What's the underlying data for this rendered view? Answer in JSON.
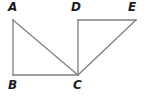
{
  "figure": {
    "kind": "geometry-diagram",
    "background_color": "#ffffff",
    "stroke_color": "#808080",
    "label_color": "#1c1c1c",
    "stroke_width": 1.3,
    "canvas": {
      "width": 148,
      "height": 102
    },
    "points": [
      {
        "id": "A",
        "label": "A",
        "x": 13,
        "y": 20,
        "label_x": 8,
        "label_y": 1
      },
      {
        "id": "B",
        "label": "B",
        "x": 13,
        "y": 75,
        "label_x": 8,
        "label_y": 79
      },
      {
        "id": "C",
        "label": "C",
        "x": 78,
        "y": 75,
        "label_x": 73,
        "label_y": 79
      },
      {
        "id": "D",
        "label": "D",
        "x": 78,
        "y": 20,
        "label_x": 71,
        "label_y": 1
      },
      {
        "id": "E",
        "label": "E",
        "x": 136,
        "y": 20,
        "label_x": 128,
        "label_y": 1
      }
    ],
    "segments": [
      {
        "id": "AB",
        "from": "A",
        "to": "B",
        "x1": 13,
        "y1": 20,
        "x2": 13,
        "y2": 75
      },
      {
        "id": "BC",
        "from": "B",
        "to": "C",
        "x1": 13,
        "y1": 75,
        "x2": 78,
        "y2": 75
      },
      {
        "id": "AC",
        "from": "A",
        "to": "C",
        "x1": 13,
        "y1": 20,
        "x2": 78,
        "y2": 75
      },
      {
        "id": "DC",
        "from": "D",
        "to": "C",
        "x1": 78,
        "y1": 20,
        "x2": 78,
        "y2": 75
      },
      {
        "id": "DE",
        "from": "D",
        "to": "E",
        "x1": 78,
        "y1": 20,
        "x2": 136,
        "y2": 20
      },
      {
        "id": "CE",
        "from": "C",
        "to": "E",
        "x1": 78,
        "y1": 75,
        "x2": 136,
        "y2": 20
      }
    ]
  }
}
